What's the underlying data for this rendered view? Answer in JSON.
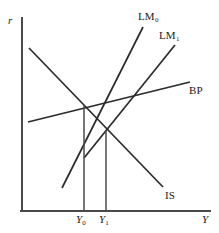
{
  "figure": {
    "type": "economics-diagram",
    "model_name": "IS-LM-BP",
    "axes": {
      "y_axis_label": "r",
      "x_axis_label": "Y",
      "origin": {
        "x": 22,
        "y": 211
      },
      "y_axis_top": {
        "x": 22,
        "y": 18
      },
      "x_axis_right": {
        "x": 210,
        "y": 211
      }
    },
    "curves": [
      {
        "id": "is",
        "label": "IS",
        "label_plain": "IS",
        "slope_direction": "downward",
        "x1": 29,
        "y1": 48,
        "x2": 163,
        "y2": 187,
        "label_x": 166,
        "label_y": 190
      },
      {
        "id": "lm0",
        "label": "LM",
        "subscript": "0",
        "label_plain": "LM0",
        "slope_direction": "upward",
        "x1": 62,
        "y1": 188,
        "x2": 143,
        "y2": 27,
        "label_x": 140,
        "label_y": 12
      },
      {
        "id": "lm1",
        "label": "LM",
        "subscript": "1",
        "label_plain": "LM1",
        "slope_direction": "upward",
        "x1": 84,
        "y1": 158,
        "x2": 175,
        "y2": 45,
        "label_x": 160,
        "label_y": 31
      },
      {
        "id": "bp",
        "label": "BP",
        "label_plain": "BP",
        "slope_direction": "upward-shallow",
        "x1": 28,
        "y1": 122,
        "x2": 190,
        "y2": 82,
        "label_x": 190,
        "label_y": 85
      }
    ],
    "equilibria": [
      {
        "id": "e0",
        "x": 84,
        "y": 105,
        "curves": [
          "IS",
          "LM0",
          "BP"
        ]
      },
      {
        "id": "e1",
        "x": 106,
        "y": 131,
        "curves": [
          "IS",
          "LM1"
        ]
      }
    ],
    "droplines": [
      {
        "id": "y0-dropline",
        "x": 84,
        "y_top": 105,
        "y_bottom": 211
      },
      {
        "id": "y1-dropline",
        "x": 106,
        "y_top": 131,
        "y_bottom": 211
      }
    ],
    "tick_labels": [
      {
        "id": "y0",
        "var": "Y",
        "subscript": "0",
        "plain": "Y0",
        "x": 78,
        "y": 214
      },
      {
        "id": "y1",
        "var": "Y",
        "subscript": "1",
        "plain": "Y1",
        "x": 100,
        "y": 214
      }
    ],
    "axis_label_positions": {
      "r": {
        "x": 8,
        "y": 20
      },
      "Y": {
        "x": 202,
        "y": 214
      }
    },
    "colors": {
      "background": "#ffffff",
      "axis": "#4a4a4a",
      "curve": "#2b2b2b",
      "dropline": "#4a4a4a",
      "text": "#1a1a1a"
    }
  }
}
